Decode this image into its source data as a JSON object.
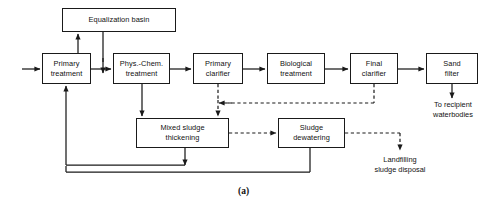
{
  "figure": {
    "caption": "(a)",
    "type": "process-flow-diagram"
  },
  "nodes": [
    {
      "id": "equalization-basin",
      "lines": [
        "Equalization basin"
      ],
      "x": 62,
      "y": 8,
      "w": 114,
      "h": 24
    },
    {
      "id": "primary-treatment",
      "lines": [
        "Primary",
        "treatment"
      ],
      "x": 42,
      "y": 53,
      "w": 49,
      "h": 31
    },
    {
      "id": "phys-chem-treatment",
      "lines": [
        "Phys.-Chem.",
        "treatment"
      ],
      "x": 113,
      "y": 53,
      "w": 57,
      "h": 31
    },
    {
      "id": "primary-clarifier",
      "lines": [
        "Primary",
        "clarifier"
      ],
      "x": 193,
      "y": 53,
      "w": 50,
      "h": 31
    },
    {
      "id": "biological-treatment",
      "lines": [
        "Biological",
        "treatment"
      ],
      "x": 267,
      "y": 53,
      "w": 58,
      "h": 31
    },
    {
      "id": "final-clarifier",
      "lines": [
        "Final",
        "clarifier"
      ],
      "x": 350,
      "y": 53,
      "w": 48,
      "h": 31
    },
    {
      "id": "sand-filter",
      "lines": [
        "Sand",
        "filter"
      ],
      "x": 426,
      "y": 53,
      "w": 52,
      "h": 31
    },
    {
      "id": "mixed-sludge-thickening",
      "lines": [
        "Mixed sludge",
        "thickening"
      ],
      "x": 136,
      "y": 118,
      "w": 93,
      "h": 30
    },
    {
      "id": "sludge-dewatering",
      "lines": [
        "Sludge",
        "dewatering"
      ],
      "x": 278,
      "y": 118,
      "w": 67,
      "h": 30
    }
  ],
  "labels": [
    {
      "id": "to-recipient-waterbodies",
      "lines": [
        "To recipient",
        "waterbodies"
      ],
      "x": 412,
      "y": 100,
      "w": 82
    },
    {
      "id": "landfilling-sludge-disposal",
      "lines": [
        "Landfilling",
        "sludge disposal"
      ],
      "x": 357,
      "y": 155,
      "w": 86
    }
  ],
  "colors": {
    "stroke": "#1a1a1a",
    "text": "#111111",
    "background": "#ffffff"
  }
}
